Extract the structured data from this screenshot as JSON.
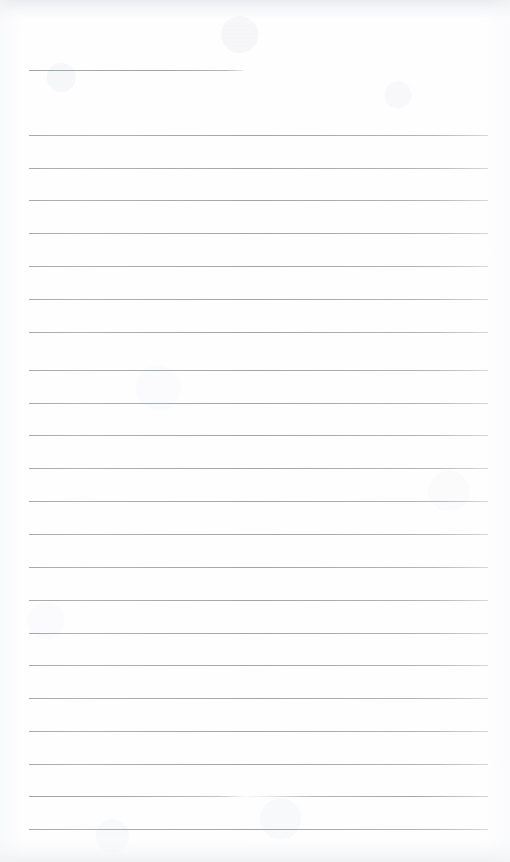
{
  "document": {
    "kind": "scanned-page",
    "title": "Blank ruled notepad page",
    "description": "Scanned sheet of lined writing paper with no handwriting or printed text",
    "page_width_px": 510,
    "page_height_px": 862,
    "paper_color": "#fefeff",
    "rule_color": "#9ea2a8",
    "rule_thickness_px": 1,
    "text_content": "",
    "visible_text_count": 0
  },
  "rules": [
    {
      "index": 1,
      "y": 70,
      "x_start": 29,
      "x_end": 243,
      "style": "short",
      "note": "short header rule"
    },
    {
      "index": 2,
      "y": 135,
      "x_start": 29,
      "x_end": 488,
      "style": "full",
      "note": ""
    },
    {
      "index": 3,
      "y": 168,
      "x_start": 29,
      "x_end": 488,
      "style": "full",
      "note": ""
    },
    {
      "index": 4,
      "y": 200,
      "x_start": 29,
      "x_end": 488,
      "style": "full",
      "note": ""
    },
    {
      "index": 5,
      "y": 233,
      "x_start": 29,
      "x_end": 488,
      "style": "full",
      "note": ""
    },
    {
      "index": 6,
      "y": 266,
      "x_start": 29,
      "x_end": 488,
      "style": "full",
      "note": ""
    },
    {
      "index": 7,
      "y": 299,
      "x_start": 29,
      "x_end": 488,
      "style": "full",
      "note": ""
    },
    {
      "index": 8,
      "y": 332,
      "x_start": 29,
      "x_end": 488,
      "style": "full",
      "note": ""
    },
    {
      "index": 9,
      "y": 370,
      "x_start": 29,
      "x_end": 488,
      "style": "full",
      "note": ""
    },
    {
      "index": 10,
      "y": 403,
      "x_start": 29,
      "x_end": 488,
      "style": "full",
      "note": ""
    },
    {
      "index": 11,
      "y": 435,
      "x_start": 29,
      "x_end": 488,
      "style": "full",
      "note": ""
    },
    {
      "index": 12,
      "y": 468,
      "x_start": 29,
      "x_end": 488,
      "style": "full",
      "note": ""
    },
    {
      "index": 13,
      "y": 501,
      "x_start": 29,
      "x_end": 488,
      "style": "full",
      "note": ""
    },
    {
      "index": 14,
      "y": 534,
      "x_start": 29,
      "x_end": 488,
      "style": "full",
      "note": ""
    },
    {
      "index": 15,
      "y": 567,
      "x_start": 29,
      "x_end": 488,
      "style": "full",
      "note": ""
    },
    {
      "index": 16,
      "y": 600,
      "x_start": 29,
      "x_end": 488,
      "style": "full",
      "note": ""
    },
    {
      "index": 17,
      "y": 633,
      "x_start": 29,
      "x_end": 488,
      "style": "full",
      "note": ""
    },
    {
      "index": 18,
      "y": 665,
      "x_start": 29,
      "x_end": 488,
      "style": "full",
      "note": ""
    },
    {
      "index": 19,
      "y": 698,
      "x_start": 29,
      "x_end": 488,
      "style": "full",
      "note": ""
    },
    {
      "index": 20,
      "y": 731,
      "x_start": 29,
      "x_end": 488,
      "style": "full",
      "note": ""
    },
    {
      "index": 21,
      "y": 764,
      "x_start": 29,
      "x_end": 488,
      "style": "full",
      "note": ""
    },
    {
      "index": 22,
      "y": 796,
      "x_start": 29,
      "x_end": 488,
      "style": "faded-mid",
      "note": "rule fades out near middle"
    },
    {
      "index": 23,
      "y": 829,
      "x_start": 29,
      "x_end": 488,
      "style": "full",
      "note": ""
    }
  ]
}
